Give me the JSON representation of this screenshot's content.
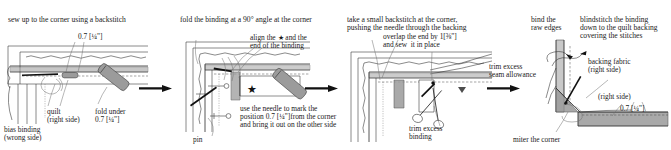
{
  "figure": {
    "panel_count": 4,
    "arrow_count": 3
  },
  "panels": [
    {
      "id": "panel-1",
      "heading": "sew up to the corner using a backstitch",
      "labels": [
        {
          "name": "seam-allowance",
          "text": "0.7 [¼\"]"
        },
        {
          "name": "quilt-right-side",
          "text": "quilt\n(right side)"
        },
        {
          "name": "fold-under",
          "text": "fold under\n0.7 [¼\"]"
        },
        {
          "name": "bias-binding-wrong-side",
          "text": "bias binding\n(wrong side)"
        }
      ]
    },
    {
      "id": "panel-2",
      "heading": "fold the binding at a 90° angle at the corner",
      "labels": [
        {
          "name": "align-star",
          "text": "align the ★ and the\nend of the binding"
        },
        {
          "name": "needle-mark",
          "text": "use the needle to mark the\nposition 0.7 [¼\"]from the corner\nand bring it out on the other side"
        },
        {
          "name": "pin",
          "text": "pin"
        }
      ]
    },
    {
      "id": "panel-3",
      "heading": "take a small backstitch at the corner,\npushing the needle through the backing",
      "labels": [
        {
          "name": "overlap-end",
          "text": "overlap the end by 1[⅜\"]\nand sew  it in place"
        },
        {
          "name": "trim-seam-allowance",
          "text": "trim excess\nseam allowance"
        },
        {
          "name": "trim-binding",
          "text": "trim excess\nbinding"
        },
        {
          "name": "miter-corner",
          "text": "miter the corner"
        }
      ]
    },
    {
      "id": "panel-4",
      "heading": "blindstitch the binding\ndown to the quilt backing\ncovering the stitches",
      "labels": [
        {
          "name": "bind-raw-edges",
          "text": "bind the\nraw edges"
        },
        {
          "name": "backing-fabric",
          "text": "backing fabric\n(right side)"
        },
        {
          "name": "right-side",
          "text": "(right side)"
        },
        {
          "name": "binding-width",
          "text": "0.7 [¼\"]"
        }
      ]
    }
  ],
  "colors": {
    "ink": "#1a1a1a",
    "line": "#2b2b2b",
    "fabric_gray": "#9b9b9b",
    "fabric_light": "#c9c9c9",
    "background": "#ffffff"
  },
  "symbols": {
    "star": "★",
    "arrow": "→",
    "scissors": "scissors-icon",
    "needle": "needle-icon",
    "pin": "pin-icon"
  }
}
